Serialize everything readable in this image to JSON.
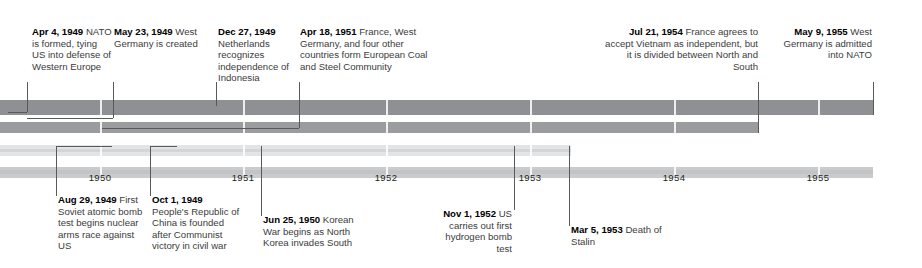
{
  "graphic": {
    "type": "historical-timeline",
    "span_start_year": 1949,
    "span_end_year": 1956
  },
  "axis": {
    "ticks": [
      {
        "label": "1950",
        "x": 100
      },
      {
        "label": "1951",
        "x": 243
      },
      {
        "label": "1952",
        "x": 386
      },
      {
        "label": "1953",
        "x": 530
      },
      {
        "label": "1954",
        "x": 674
      },
      {
        "label": "1955",
        "x": 818
      }
    ]
  },
  "bands": [
    {
      "name": "band-1",
      "color": "#8e9094",
      "end_x": 873
    },
    {
      "name": "band-2",
      "color": "#9a9c9f",
      "end_x": 758
    },
    {
      "name": "band-3",
      "color": "#e3e4e5",
      "end_x": 571
    },
    {
      "name": "band-4",
      "color": "#c9cbcc",
      "end_x": 873
    }
  ],
  "events_above": [
    {
      "date": "Apr 4, 1949",
      "text": "NATO is formed, tying US into defense of Western Europe",
      "align": "left",
      "text_x": 32,
      "text_y": 26,
      "text_w": 80,
      "leader_x": 27,
      "leader_top": 82,
      "leader_bottom": 112,
      "elbow_to_x": 8
    },
    {
      "date": "May 23, 1949",
      "text": "West Germany is created",
      "align": "left",
      "text_x": 114,
      "text_y": 26,
      "text_w": 90,
      "leader_x": 113,
      "leader_top": 82,
      "leader_bottom": 118,
      "elbow_to_x": 27
    },
    {
      "date": "Dec 27, 1949",
      "text": "Netherlands recognizes independence of Indonesia",
      "align": "left",
      "text_x": 218,
      "text_y": 26,
      "text_w": 82,
      "leader_x": 216,
      "leader_top": 82,
      "leader_bottom": 106,
      "elbow_to_x": 216
    },
    {
      "date": "Apr 18, 1951",
      "text": "France, West Germany, and four other countries form European Coal and Steel Community",
      "align": "left",
      "text_x": 300,
      "text_y": 26,
      "text_w": 130,
      "leader_x": 299,
      "leader_top": 82,
      "leader_bottom": 128,
      "elbow_to_x": 102
    },
    {
      "date": "Jul 21, 1954",
      "text": "France agrees to accept Vietnam as independent, but it is divided between North and South",
      "align": "right",
      "text_x": 600,
      "text_y": 26,
      "text_w": 158,
      "leader_x": 758,
      "leader_top": 82,
      "leader_bottom": 133,
      "elbow_to_x": 758
    },
    {
      "date": "May 9, 1955",
      "text": "West Germany is admitted into NATO",
      "align": "right",
      "text_x": 780,
      "text_y": 26,
      "text_w": 92,
      "leader_x": 873,
      "leader_top": 82,
      "leader_bottom": 115,
      "elbow_to_x": 873
    }
  ],
  "events_below": [
    {
      "date": "Aug 29, 1949",
      "text": "First Soviet atomic bomb test begins nuclear arms race against US",
      "align": "left",
      "text_x": 58,
      "text_y": 194,
      "text_w": 85,
      "leader_x": 56,
      "leader_top": 146,
      "leader_bottom": 196,
      "elbow_to_x": 112
    },
    {
      "date": "Oct 1, 1949",
      "text": "People's Republic of China is founded after Communist victory in civil war",
      "align": "left",
      "text_x": 152,
      "text_y": 194,
      "text_w": 88,
      "leader_x": 150,
      "leader_top": 146,
      "leader_bottom": 196,
      "elbow_to_x": 177
    },
    {
      "date": "Jun 25, 1950",
      "text": "Korean War begins as North Korea invades South",
      "align": "left",
      "text_x": 263,
      "text_y": 214,
      "text_w": 96,
      "leader_x": 261,
      "leader_top": 146,
      "leader_bottom": 216,
      "elbow_to_x": 261
    },
    {
      "date": "Nov 1, 1952",
      "text": "US carries out first hydrogen bomb test",
      "align": "right",
      "text_x": 440,
      "text_y": 208,
      "text_w": 72,
      "leader_x": 514,
      "leader_top": 146,
      "leader_bottom": 210,
      "elbow_to_x": 514
    },
    {
      "date": "Mar 5, 1953",
      "text": "Death of Stalin",
      "align": "left",
      "text_x": 571,
      "text_y": 224,
      "text_w": 100,
      "leader_x": 569,
      "leader_top": 146,
      "leader_bottom": 226,
      "elbow_to_x": 569
    }
  ]
}
